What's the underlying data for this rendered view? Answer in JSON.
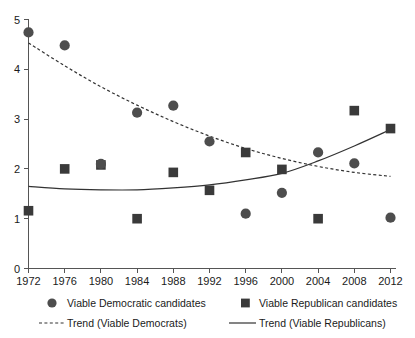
{
  "chart_data": {
    "type": "scatter",
    "title": "",
    "xlabel": "",
    "ylabel": "",
    "x": [
      1972,
      1976,
      1980,
      1984,
      1988,
      1992,
      1996,
      2000,
      2004,
      2008,
      2012
    ],
    "xticklabels": [
      "1972",
      "1976",
      "1980",
      "1984",
      "1988",
      "1992",
      "1996",
      "2000",
      "2004",
      "2008",
      "2012"
    ],
    "yticklabels": [
      "0",
      "1",
      "2",
      "3",
      "4",
      "5"
    ],
    "yticks": [
      0,
      1,
      2,
      3,
      4,
      5
    ],
    "xlim": [
      1972,
      2012
    ],
    "ylim": [
      0,
      5
    ],
    "grid": false,
    "legend_position": "below-axes",
    "series": [
      {
        "name": "Viable Democratic candidates",
        "marker": "circle",
        "color": "#4d4d4d",
        "values": [
          4.74,
          4.48,
          2.1,
          3.13,
          3.27,
          2.55,
          1.1,
          1.52,
          2.33,
          2.11,
          1.02
        ]
      },
      {
        "name": "Viable Republican candidates",
        "marker": "square",
        "color": "#3a3a3a",
        "values": [
          1.16,
          2.0,
          2.08,
          1.0,
          1.93,
          1.57,
          2.33,
          1.99,
          1.0,
          3.17,
          2.81
        ]
      },
      {
        "name": "Trend (Viable Democrats)",
        "marker": "dashed-line",
        "color": "#333333",
        "values": [
          4.53,
          4.07,
          3.65,
          3.28,
          2.95,
          2.66,
          2.41,
          2.21,
          2.05,
          1.93,
          1.85
        ]
      },
      {
        "name": "Trend (Viable Republicans)",
        "marker": "solid-line",
        "color": "#333333",
        "values": [
          1.65,
          1.6,
          1.58,
          1.58,
          1.62,
          1.68,
          1.78,
          1.91,
          2.16,
          2.46,
          2.79
        ]
      }
    ]
  },
  "legend": {
    "dem_points_label": "Viable Democratic candidates",
    "rep_points_label": "Viable Republican candidates",
    "dem_trend_label": "Trend (Viable Democrats)",
    "rep_trend_label": "Trend (Viable Republicans)"
  },
  "axis": {
    "y_tick_0": "0",
    "y_tick_1": "1",
    "y_tick_2": "2",
    "y_tick_3": "3",
    "y_tick_4": "4",
    "y_tick_5": "5",
    "x_tick_0": "1972",
    "x_tick_1": "1976",
    "x_tick_2": "1980",
    "x_tick_3": "1984",
    "x_tick_4": "1988",
    "x_tick_5": "1992",
    "x_tick_6": "1996",
    "x_tick_7": "2000",
    "x_tick_8": "2004",
    "x_tick_9": "2008",
    "x_tick_10": "2012"
  }
}
